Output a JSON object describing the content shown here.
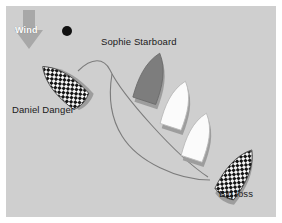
{
  "figure": {
    "kind": "sailing-racing-rules-diagram",
    "background_color": "#ffffff",
    "panel_color": "#cfcfcf",
    "ink_color": "#1a1a1a",
    "wake_color": "#7a7a7a",
    "shadow_color": "#9a9a9a"
  },
  "wind": {
    "label": "Wind",
    "direction": "down",
    "arrow_color": "#a8a8a8",
    "label_color": "#ffffff"
  },
  "mark": {
    "name": "racing-mark",
    "color": "#111111",
    "cx": 67,
    "cy": 31,
    "r": 5
  },
  "boats": [
    {
      "id": "daniel-danger",
      "label": "Daniel Danger",
      "hull_style": "checkered",
      "hull_fill": "#f2f2f2",
      "pattern_color": "#141414",
      "label_x": 12,
      "label_y": 104,
      "cx": 62,
      "cy": 84,
      "rotation": -48,
      "length": 52,
      "beam": 24
    },
    {
      "id": "sophie-starboard",
      "label": "Sophie Starboard",
      "hull_style": "solid-gray",
      "hull_fill": "#7d7d7d",
      "label_x": 101,
      "label_y": 36,
      "cx": 152,
      "cy": 77,
      "rotation": 18,
      "length": 50,
      "beam": 25
    },
    {
      "id": "white-boat-middle",
      "label": "",
      "hull_style": "solid-white",
      "hull_fill": "#fbfbfb",
      "cx": 178,
      "cy": 104,
      "rotation": 18,
      "length": 48,
      "beam": 24
    },
    {
      "id": "white-boat-lower",
      "label": "",
      "hull_style": "solid-white",
      "hull_fill": "#fbfbfb",
      "cx": 199,
      "cy": 136,
      "rotation": 18,
      "length": 48,
      "beam": 24
    },
    {
      "id": "big-loss",
      "label": "Big loss",
      "hull_style": "checkered",
      "hull_fill": "#f2f2f2",
      "pattern_color": "#141414",
      "label_x": 219,
      "label_y": 188,
      "cx": 238,
      "cy": 172,
      "rotation": 32,
      "length": 52,
      "beam": 24
    }
  ],
  "tracks": [
    {
      "id": "daniel-danger-wake",
      "description": "curved wake from Daniel Danger stern arcing right then down to Big loss",
      "path": "M 78 71 C 92 57 104 58 110 70 C 122 95 176 156 208 177"
    },
    {
      "id": "big-loss-wake",
      "description": "lower wake running left from Big loss bow then up the left side",
      "path": "M 210 180 C 178 180 138 162 122 136 C 112 120 108 98 112 74"
    }
  ]
}
